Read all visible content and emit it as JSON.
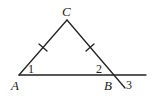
{
  "diagram": {
    "type": "geometry-triangle",
    "vertices": {
      "A": {
        "label": "A",
        "x": 19,
        "y": 75
      },
      "B": {
        "label": "B",
        "x": 114,
        "y": 75
      },
      "C": {
        "label": "C",
        "x": 67,
        "y": 20
      }
    },
    "extensions": {
      "base_line_end": {
        "x": 146,
        "y": 75
      },
      "cb_extension_end": {
        "x": 125,
        "y": 88
      }
    },
    "angle_labels": {
      "angle1": "1",
      "angle2": "2",
      "angle3": "3"
    },
    "tick_marks": [
      "AC",
      "CB"
    ],
    "stroke_color": "#222222",
    "background": "#ffffff"
  }
}
